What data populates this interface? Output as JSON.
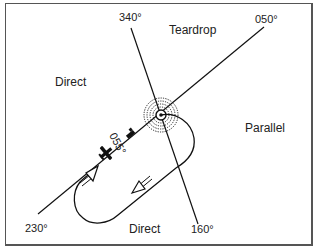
{
  "diagram": {
    "regions": {
      "teardrop": "Teardrop",
      "direct_left": "Direct",
      "parallel": "Parallel",
      "direct_bottom": "Direct"
    },
    "bearings": {
      "b340": "340°",
      "b050": "050°",
      "b230": "230°",
      "b160": "160°"
    },
    "inbound_course_label": "055°",
    "colors": {
      "line": "#111111",
      "text": "#222222",
      "frame": "#555555",
      "background": "#ffffff"
    },
    "icons": {
      "fix": "navaid-fix-icon",
      "aircraft": "aircraft-icon",
      "wind_flag": "wind-flag-icon"
    }
  }
}
